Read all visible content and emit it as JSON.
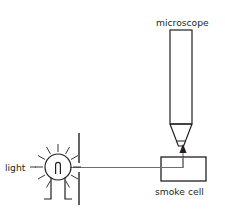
{
  "figure": {
    "title_visible": false,
    "background_color": "#ffffff",
    "line_color": "#231f20",
    "ray_color": "#6d6e71",
    "width": 225,
    "height": 210
  },
  "labels": {
    "microscope": "microscope",
    "light": "light",
    "smoke_cell": "smoke cell"
  },
  "parts": {
    "microscope": {
      "name": "microscope",
      "barrel_x": 170,
      "barrel_y": 30,
      "barrel_w": 22,
      "barrel_h": 94,
      "taper_bottom_w": 9,
      "taper_h": 17,
      "tip_h": 6
    },
    "smoke_cell": {
      "name": "smoke cell",
      "x": 161,
      "y": 157,
      "w": 45,
      "h": 24
    },
    "light_bulb": {
      "name": "light bulb",
      "cx": 58,
      "cy": 167,
      "r": 13,
      "ray_count": 12,
      "ray_inner": 15,
      "ray_outer": 23
    },
    "barrier": {
      "name": "barrier with slit",
      "x": 79,
      "y_top": 133,
      "y_bottom": 205,
      "slit_y": 167,
      "slit_gap": 7
    },
    "light_ray": {
      "name": "light ray",
      "y": 167,
      "x_start": 72,
      "x_end": 183
    },
    "scatter_ray": {
      "name": "scattered light to microscope",
      "x": 183,
      "y_start": 167,
      "y_end": 130
    }
  },
  "label_positions": {
    "microscope": {
      "x": 156,
      "y": 26
    },
    "light": {
      "x": 5,
      "y": 171
    },
    "smoke_cell": {
      "x": 155,
      "y": 195
    }
  }
}
